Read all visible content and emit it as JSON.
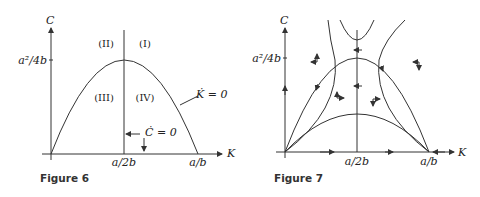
{
  "figure6": {
    "caption": "Figure 6",
    "axis_y_label": "C",
    "axis_x_label": "K",
    "y_tick": "a²/4b",
    "x_ticks": [
      "a/2b",
      "a/b"
    ],
    "regions": [
      "(II)",
      "(I)",
      "(III)",
      "(IV)"
    ],
    "curve_labels": {
      "k_dot": "K̇ = 0",
      "c_dot": "Ċ = 0"
    }
  },
  "figure7": {
    "caption": "Figure 7",
    "axis_y_label": "C",
    "axis_x_label": "K",
    "y_tick": "a²/4b",
    "x_ticks": [
      "a/2b",
      "a/b"
    ]
  }
}
